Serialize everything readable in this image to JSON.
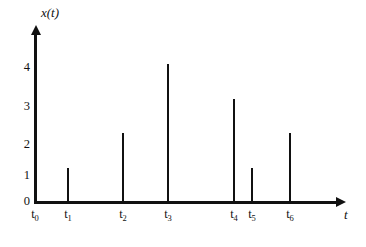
{
  "chart_data": {
    "type": "bar",
    "title": "",
    "subtitle": "",
    "xlabel": "t",
    "ylabel": "x(t)",
    "categories": [
      "t0",
      "t1",
      "t2",
      "t3",
      "t4",
      "t5",
      "t6"
    ],
    "category_labels": [
      "t",
      "t",
      "t",
      "t",
      "t",
      "t",
      "t"
    ],
    "category_subscripts": [
      "0",
      "1",
      "2",
      "3",
      "4",
      "5",
      "6"
    ],
    "values": [
      0,
      1,
      2,
      4,
      3,
      1,
      2
    ],
    "ylim": [
      0,
      4
    ],
    "yticks": [
      0,
      1,
      2,
      3,
      4
    ],
    "ytick_labels": [
      "0",
      "1",
      "2",
      "3",
      "4"
    ],
    "grid": false,
    "legend": null,
    "annotations": [],
    "style": "impulse-stem-plot",
    "line_color": "#111111",
    "background_color": "#ffffff",
    "x_positions_px": [
      35,
      68,
      123,
      168,
      234,
      252,
      290
    ]
  },
  "axes": {
    "y_title": "x(t)",
    "x_title": "t",
    "y_tick_0": "0",
    "y_tick_1": "1",
    "y_tick_2": "2",
    "y_tick_3": "3",
    "y_tick_4": "4"
  }
}
